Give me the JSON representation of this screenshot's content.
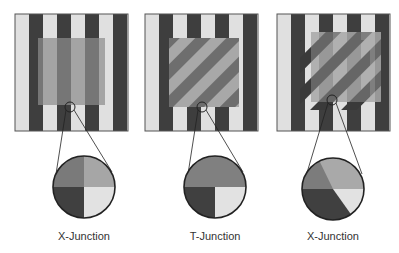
{
  "figure": {
    "colors": {
      "stripe_light": "#e0e0e0",
      "stripe_dark": "#3e3e3e",
      "overlay_light": "#a8a8a8",
      "overlay_dark": "#6e6e6e",
      "outline": "#222222"
    },
    "panels": [
      {
        "id": "panel-1",
        "label": "X-Junction",
        "description": "Vertical stripes seen through a uniform transparent gray square",
        "junction_quadrants": [
          "#7a7a7a",
          "#a6a6a6",
          "#404040",
          "#e2e2e2"
        ]
      },
      {
        "id": "panel-2",
        "label": "T-Junction",
        "description": "Opaque square with diagonal stripes occluding vertical stripes",
        "junction_quadrants": [
          "#808080",
          "#808080",
          "#404040",
          "#e2e2e2"
        ]
      },
      {
        "id": "panel-3",
        "label": "X-Junction",
        "description": "Diagonal striped transparent square over vertical stripes with offset shadow",
        "junction_quadrants": [
          "#a9a9a9",
          "#7c7c7c",
          "#404040",
          "#e2e2e2"
        ]
      }
    ]
  }
}
